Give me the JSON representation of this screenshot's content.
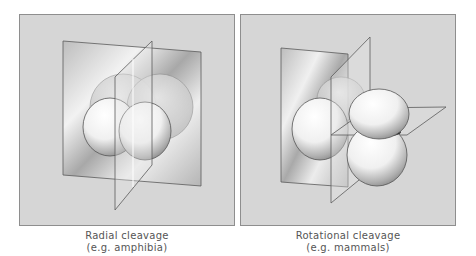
{
  "figure": {
    "panels": [
      {
        "id": "radial",
        "caption_line1": "Radial cleavage",
        "caption_line2": "(e.g. amphibia)",
        "description": "Four blastomeres aligned directly above each other, divided by two perpendicular cleavage planes"
      },
      {
        "id": "rotational",
        "caption_line1": "Rotational cleavage",
        "caption_line2": "(e.g. mammals)",
        "description": "Four blastomeres with one pair rotated 90 degrees, divided by meridional and equatorial cleavage planes"
      }
    ],
    "colors": {
      "panel_bg": "#d6d6d6",
      "panel_border": "#8e8e8e",
      "plane_edge": "#5a5a5a",
      "caption_text": "#555555"
    }
  }
}
